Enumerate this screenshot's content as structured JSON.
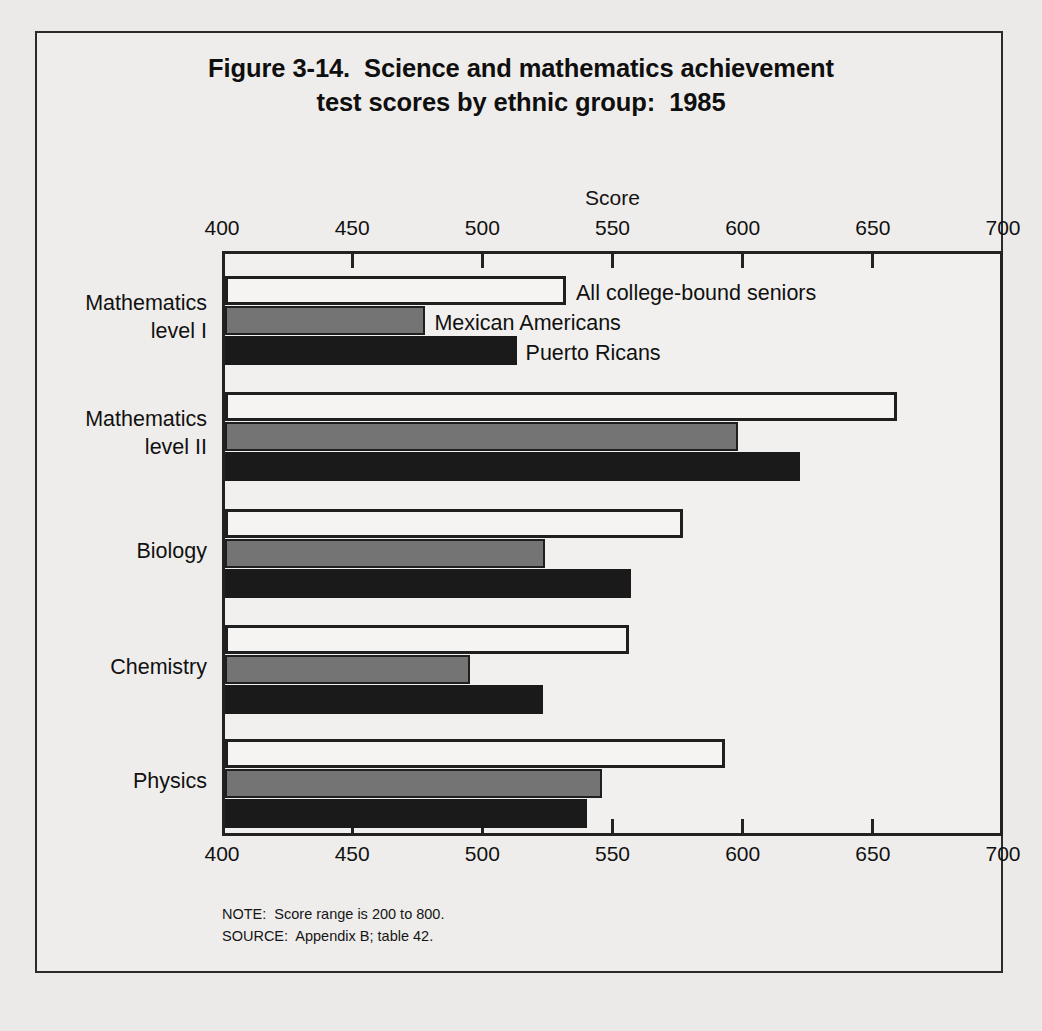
{
  "figure": {
    "title_line1": "Figure 3-14.  Science and mathematics achievement",
    "title_line2": "test scores by ethnic group:  1985",
    "note": "NOTE:  Score range is 200 to 800.",
    "source": "SOURCE:  Appendix B; table 42."
  },
  "chart_data": {
    "type": "bar",
    "orientation": "horizontal",
    "title": "Figure 3-14.  Science and mathematics achievement test scores by ethnic group:  1985",
    "xlabel": "Score",
    "ylabel": "",
    "xlim": [
      400,
      700
    ],
    "xticks": [
      400,
      450,
      500,
      550,
      600,
      650,
      700
    ],
    "xtick_labels": [
      "400",
      "450",
      "500",
      "550",
      "600",
      "650",
      "700"
    ],
    "axis_position": "both-top-and-bottom",
    "grid": false,
    "legend_position": "inline-first-group",
    "categories": [
      "Mathematics level I",
      "Mathematics level II",
      "Biology",
      "Chemistry",
      "Physics"
    ],
    "category_lines": [
      [
        "Mathematics",
        "level I"
      ],
      [
        "Mathematics",
        "level II"
      ],
      [
        "Biology"
      ],
      [
        "Chemistry"
      ],
      [
        "Physics"
      ]
    ],
    "series": [
      {
        "name": "All college-bound seniors",
        "color": "#f6f4f2",
        "edge": "#1f1f1f",
        "values": [
          531,
          658,
          576,
          555,
          592
        ]
      },
      {
        "name": "Mexican Americans",
        "color": "#747474",
        "edge": "#1f1f1f",
        "values": [
          477,
          597,
          523,
          494,
          545
        ]
      },
      {
        "name": "Puerto Ricans",
        "color": "#1a1a1a",
        "edge": "#1a1a1a",
        "values": [
          512,
          621,
          556,
          522,
          539
        ]
      }
    ],
    "note": "NOTE:  Score range is 200 to 800.",
    "source": "SOURCE:  Appendix B; table 42."
  }
}
